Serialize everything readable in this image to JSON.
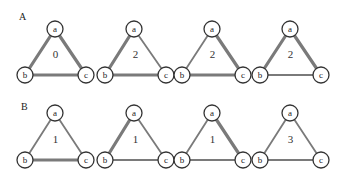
{
  "rows": [
    {
      "label": "A",
      "triangles": [
        {
          "count": "0",
          "nodes": {
            "a": "a",
            "b": "b",
            "c": "c"
          },
          "edges": {
            "ab": "thick",
            "ac": "thick",
            "bc": "thick"
          }
        },
        {
          "count": "2",
          "nodes": {
            "a": "a",
            "b": "b",
            "c": "c"
          },
          "edges": {
            "ab": "thick",
            "ac": "thin",
            "bc": "thick"
          }
        },
        {
          "count": "2",
          "nodes": {
            "a": "a",
            "b": "b",
            "c": "c"
          },
          "edges": {
            "ab": "thin",
            "ac": "thick",
            "bc": "thick"
          }
        },
        {
          "count": "2",
          "nodes": {
            "a": "a",
            "b": "b",
            "c": "c"
          },
          "edges": {
            "ab": "thick",
            "ac": "thick",
            "bc": "thin"
          }
        }
      ]
    },
    {
      "label": "B",
      "triangles": [
        {
          "count": "1",
          "nodes": {
            "a": "a",
            "b": "b",
            "c": "c"
          },
          "edges": {
            "ab": "thin",
            "ac": "thin",
            "bc": "thick"
          }
        },
        {
          "count": "1",
          "nodes": {
            "a": "a",
            "b": "b",
            "c": "c"
          },
          "edges": {
            "ab": "thick",
            "ac": "thin",
            "bc": "thin"
          }
        },
        {
          "count": "1",
          "nodes": {
            "a": "a",
            "b": "b",
            "c": "c"
          },
          "edges": {
            "ab": "thin",
            "ac": "thick",
            "bc": "thin"
          }
        },
        {
          "count": "3",
          "nodes": {
            "a": "a",
            "b": "b",
            "c": "c"
          },
          "edges": {
            "ab": "thin",
            "ac": "thin",
            "bc": "thin"
          }
        }
      ]
    }
  ],
  "colors": {
    "edge": "#7a7a7a",
    "node_stroke": "#333333",
    "background": "#ffffff"
  }
}
